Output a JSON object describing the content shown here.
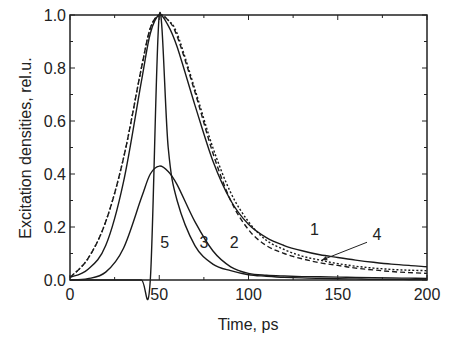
{
  "chart_data": {
    "type": "line",
    "title": "",
    "xlabel": "Time, ps",
    "ylabel": "Excitation densities,  rel.u.",
    "xlim": [
      0,
      200
    ],
    "ylim": [
      0,
      1.0
    ],
    "grid": false,
    "legend": "inline numeric curve labels",
    "x_ticks": [
      0,
      50,
      100,
      150,
      200
    ],
    "x_tick_labels": [
      "0",
      "50",
      "100",
      "150",
      "200"
    ],
    "y_ticks": [
      0.0,
      0.2,
      0.4,
      0.6,
      0.8,
      1.0
    ],
    "y_tick_labels": [
      "0.0",
      "0.2",
      "0.4",
      "0.6",
      "0.8",
      "1.0"
    ],
    "x": [
      0,
      10,
      20,
      30,
      40,
      45,
      50,
      55,
      60,
      70,
      80,
      90,
      100,
      110,
      120,
      130,
      140,
      150,
      160,
      170,
      180,
      190,
      200
    ],
    "series": [
      {
        "name": "1",
        "style": "solid",
        "values": [
          0.01,
          0.04,
          0.13,
          0.37,
          0.75,
          0.93,
          1.0,
          0.96,
          0.88,
          0.66,
          0.45,
          0.3,
          0.21,
          0.16,
          0.13,
          0.11,
          0.095,
          0.085,
          0.075,
          0.067,
          0.06,
          0.055,
          0.05
        ]
      },
      {
        "name": "2",
        "style": "dashed",
        "values": [
          0.01,
          0.08,
          0.22,
          0.46,
          0.8,
          0.95,
          1.0,
          0.98,
          0.92,
          0.71,
          0.48,
          0.3,
          0.19,
          0.13,
          0.1,
          0.08,
          0.065,
          0.055,
          0.045,
          0.038,
          0.032,
          0.028,
          0.025
        ]
      },
      {
        "name": "3",
        "style": "solid",
        "values": [
          0.0,
          0.0,
          0.0,
          0.0,
          0.0,
          0.0,
          1.0,
          0.5,
          0.3,
          0.13,
          0.06,
          0.035,
          0.02,
          0.014,
          0.01,
          0.008,
          0.006,
          0.005,
          0.004,
          0.003,
          0.003,
          0.002,
          0.002
        ]
      },
      {
        "name": "4",
        "style": "dotted",
        "values": [
          0.01,
          0.08,
          0.22,
          0.46,
          0.8,
          0.95,
          1.0,
          0.98,
          0.93,
          0.72,
          0.5,
          0.33,
          0.22,
          0.15,
          0.115,
          0.09,
          0.075,
          0.062,
          0.052,
          0.045,
          0.04,
          0.037,
          0.035
        ]
      },
      {
        "name": "5",
        "style": "solid",
        "values": [
          0.0,
          0.005,
          0.03,
          0.12,
          0.31,
          0.4,
          0.43,
          0.41,
          0.36,
          0.22,
          0.11,
          0.05,
          0.025,
          0.018,
          0.015,
          0.013,
          0.012,
          0.011,
          0.01,
          0.009,
          0.008,
          0.007,
          0.006
        ]
      }
    ],
    "annotations": [
      {
        "text": "1",
        "x": 137,
        "y": 0.17
      },
      {
        "text": "2",
        "x": 92,
        "y": 0.12
      },
      {
        "text": "3",
        "x": 75,
        "y": 0.12
      },
      {
        "text": "4",
        "x": 172,
        "y": 0.15,
        "arrow_to": [
          141,
          0.075
        ]
      },
      {
        "text": "5",
        "x": 53,
        "y": 0.12
      }
    ]
  }
}
